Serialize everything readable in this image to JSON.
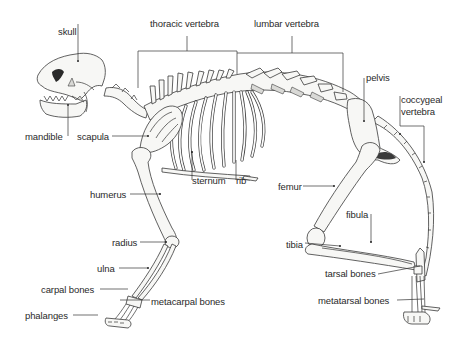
{
  "diagram": {
    "background": "#ffffff",
    "ink_color": "#2a2a2a",
    "labels": [
      {
        "id": "skull",
        "text": "skull"
      },
      {
        "id": "thoracic-vertebra",
        "text": "thoracic vertebra"
      },
      {
        "id": "lumbar-vertebra",
        "text": "lumbar vertebra"
      },
      {
        "id": "pelvis",
        "text": "pelvis"
      },
      {
        "id": "coccygeal-vertebra-line1",
        "text": "coccygeal"
      },
      {
        "id": "coccygeal-vertebra-line2",
        "text": "vertebra"
      },
      {
        "id": "mandible",
        "text": "mandible"
      },
      {
        "id": "scapula",
        "text": "scapula"
      },
      {
        "id": "sternum",
        "text": "sternum"
      },
      {
        "id": "rib",
        "text": "rib"
      },
      {
        "id": "humerus",
        "text": "humerus"
      },
      {
        "id": "femur",
        "text": "femur"
      },
      {
        "id": "fibula",
        "text": "fibula"
      },
      {
        "id": "tibia",
        "text": "tibia"
      },
      {
        "id": "radius",
        "text": "radius"
      },
      {
        "id": "ulna",
        "text": "ulna"
      },
      {
        "id": "carpal-bones",
        "text": "carpal bones"
      },
      {
        "id": "metacarpal-bones",
        "text": "metacarpal bones"
      },
      {
        "id": "tarsal-bones",
        "text": "tarsal bones"
      },
      {
        "id": "metatarsal-bones",
        "text": "metatarsal bones"
      },
      {
        "id": "phalanges",
        "text": "phalanges"
      }
    ]
  }
}
